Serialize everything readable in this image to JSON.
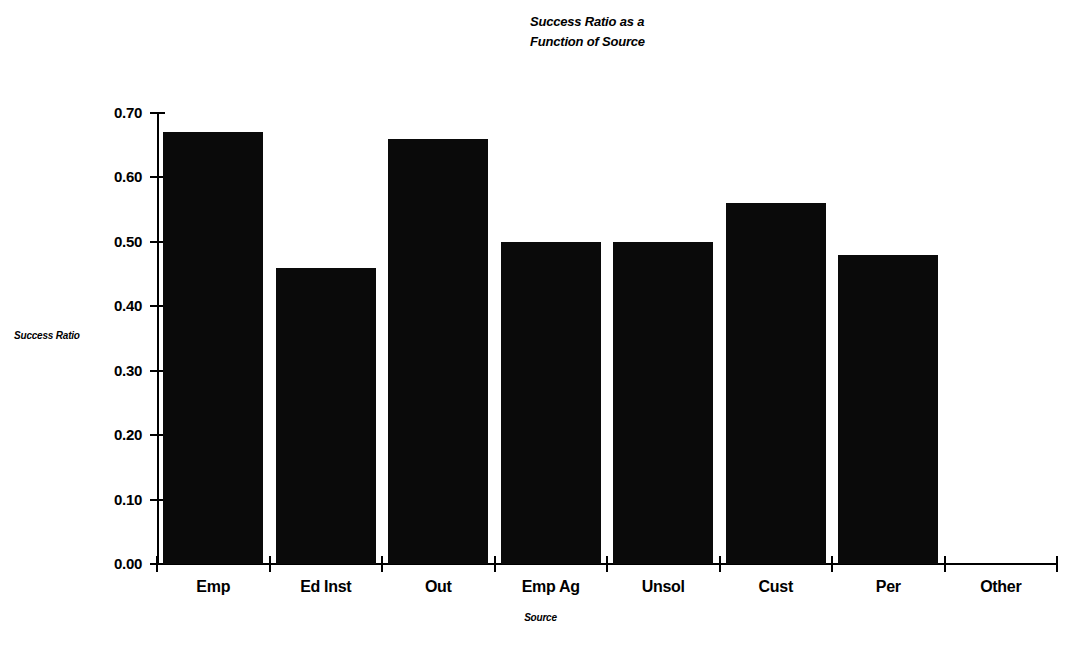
{
  "chart_data": {
    "type": "bar",
    "title": "Success Ratio as a Function of Source",
    "title_lines": [
      "Success Ratio as a",
      "Function of Source"
    ],
    "xlabel": "Source",
    "ylabel": "Success Ratio",
    "categories": [
      "Emp",
      "Ed Inst",
      "Out",
      "Emp Ag",
      "Unsol",
      "Cust",
      "Per",
      "Other"
    ],
    "values": [
      0.67,
      0.46,
      0.66,
      0.5,
      0.5,
      0.56,
      0.48,
      0.0
    ],
    "ylim": [
      0.0,
      0.7
    ],
    "ytick_values": [
      0.0,
      0.1,
      0.2,
      0.3,
      0.4,
      0.5,
      0.6,
      0.7
    ],
    "ytick_labels": [
      "0.00",
      "0.10",
      "0.20",
      "0.30",
      "0.40",
      "0.50",
      "0.60",
      "0.70"
    ],
    "grid": false,
    "legend": false,
    "bar_color": "#0a0a0a",
    "background_color": "#ffffff"
  }
}
